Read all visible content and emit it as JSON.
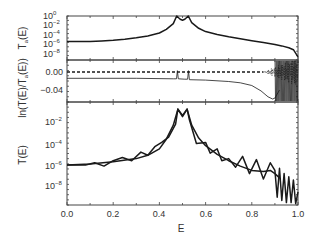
{
  "chart_data": [
    {
      "type": "line",
      "panel": "top",
      "ylabel": "T_a(E)",
      "yscale": "log",
      "ylim_log10": [
        -9.2,
        0.2
      ],
      "yticks": [
        "10^0",
        "10^-2",
        "10^-4",
        "10^-6",
        "10^-8"
      ],
      "xlim": [
        0.0,
        1.0
      ],
      "series": [
        {
          "name": "T_a(E)",
          "style": "solid-thick",
          "x": [
            0.0,
            0.05,
            0.1,
            0.15,
            0.2,
            0.25,
            0.3,
            0.35,
            0.4,
            0.43,
            0.46,
            0.475,
            0.49,
            0.5,
            0.51,
            0.525,
            0.54,
            0.57,
            0.6,
            0.65,
            0.7,
            0.75,
            0.8,
            0.85,
            0.9,
            0.93,
            0.96,
            0.98,
            1.0
          ],
          "log10": [
            -5.6,
            -5.6,
            -5.55,
            -5.45,
            -5.3,
            -5.1,
            -4.8,
            -4.4,
            -3.8,
            -3.0,
            -1.8,
            -0.2,
            -0.9,
            -1.1,
            -0.9,
            -0.2,
            -1.6,
            -2.8,
            -3.5,
            -4.1,
            -4.6,
            -5.0,
            -5.4,
            -5.8,
            -6.2,
            -6.5,
            -6.9,
            -7.3,
            -8.8
          ]
        }
      ]
    },
    {
      "type": "line",
      "panel": "middle",
      "ylabel": "ln(T(E)/T_a(E))",
      "ylim": [
        -0.065,
        0.02
      ],
      "yticks": [
        "0.00",
        "-0.04"
      ],
      "xlim": [
        0.0,
        1.0
      ],
      "series": [
        {
          "name": "reference (dashed)",
          "style": "dashed",
          "x": [
            0.0,
            0.85
          ],
          "y": [
            0.0,
            0.0
          ]
        },
        {
          "name": "ln(T/T_a)",
          "style": "solid-thin",
          "x": [
            0.0,
            0.3,
            0.46,
            0.474,
            0.478,
            0.482,
            0.51,
            0.522,
            0.526,
            0.53,
            0.6,
            0.7,
            0.75,
            0.8,
            0.84,
            0.87,
            0.89,
            0.9,
            0.92
          ],
          "y": [
            -0.014,
            -0.014,
            -0.015,
            -0.015,
            0.003,
            -0.015,
            -0.016,
            -0.016,
            0.003,
            -0.017,
            -0.018,
            -0.021,
            -0.024,
            -0.03,
            -0.042,
            -0.055,
            -0.06,
            -0.058,
            -0.04
          ]
        }
      ],
      "annotation": "dense oscillations between E≈0.85 and 1.0"
    },
    {
      "type": "line",
      "panel": "bottom",
      "ylabel": "T(E)",
      "xlabel": "E",
      "yscale": "log",
      "ylim_log10": [
        -9.8,
        -0.7
      ],
      "yticks": [
        "10^-2",
        "10^-4",
        "10^-6",
        "10^-8"
      ],
      "xlim": [
        0.0,
        1.0
      ],
      "xticks": [
        "0.0",
        "0.2",
        "0.4",
        "0.6",
        "0.8",
        "1.0"
      ],
      "series": [
        {
          "name": "smooth envelope",
          "style": "solid-thick",
          "x": [
            0.0,
            0.1,
            0.2,
            0.3,
            0.35,
            0.4,
            0.43,
            0.46,
            0.48,
            0.5,
            0.52,
            0.54,
            0.57,
            0.6,
            0.65,
            0.7,
            0.75,
            0.8,
            0.85,
            0.88,
            0.9,
            0.92
          ],
          "log10": [
            -6.0,
            -5.9,
            -5.7,
            -5.4,
            -5.1,
            -4.5,
            -3.6,
            -2.3,
            -0.8,
            -1.5,
            -0.8,
            -2.3,
            -3.5,
            -4.2,
            -5.0,
            -5.6,
            -6.1,
            -6.5,
            -6.6,
            -6.5,
            -6.8,
            -7.2
          ]
        },
        {
          "name": "oscillating T(E)",
          "style": "solid-thick",
          "x": [
            0.0,
            0.08,
            0.12,
            0.16,
            0.2,
            0.24,
            0.28,
            0.32,
            0.35,
            0.38,
            0.41,
            0.44,
            0.47,
            0.48,
            0.5,
            0.52,
            0.53,
            0.56,
            0.6,
            0.62,
            0.65,
            0.67,
            0.7,
            0.73,
            0.76,
            0.79,
            0.82,
            0.85,
            0.88,
            0.9,
            0.91,
            0.92,
            0.93,
            0.94,
            0.95,
            0.96,
            0.97,
            0.98,
            0.99,
            1.0
          ],
          "log10": [
            -6.0,
            -6.0,
            -5.8,
            -6.1,
            -5.6,
            -5.3,
            -5.6,
            -4.8,
            -5.1,
            -4.3,
            -3.9,
            -3.4,
            -2.2,
            -0.8,
            -1.4,
            -0.8,
            -1.8,
            -4.0,
            -3.9,
            -4.9,
            -4.5,
            -5.6,
            -5.4,
            -6.2,
            -5.2,
            -6.8,
            -5.5,
            -7.3,
            -5.8,
            -6.5,
            -9.0,
            -6.3,
            -9.3,
            -6.8,
            -9.5,
            -7.1,
            -9.5,
            -7.4,
            -9.6,
            -8.5
          ]
        }
      ]
    }
  ],
  "axes": {
    "top_ylabel": "T",
    "top_ylabel_sub": "a",
    "top_ylabel_tail": "(E)",
    "mid_ylabel_pre": "ln(T(E)/T",
    "mid_ylabel_sub": "a",
    "mid_ylabel_tail": "(E))",
    "bottom_ylabel": "T(E)",
    "xlabel": "E",
    "xticks": [
      "0.0",
      "0.2",
      "0.4",
      "0.6",
      "0.8",
      "1.0"
    ],
    "top_yticks": [
      {
        "base": "10",
        "exp": "0"
      },
      {
        "base": "10",
        "exp": "−2"
      },
      {
        "base": "10",
        "exp": "−4"
      },
      {
        "base": "10",
        "exp": "−6"
      },
      {
        "base": "10",
        "exp": "−8"
      }
    ],
    "mid_yticks": [
      "0.00",
      "−0.04"
    ],
    "bottom_yticks": [
      {
        "base": "10",
        "exp": "−2"
      },
      {
        "base": "10",
        "exp": "−4"
      },
      {
        "base": "10",
        "exp": "−6"
      },
      {
        "base": "10",
        "exp": "−8"
      }
    ]
  },
  "colors": {
    "line": "#1a1a1a",
    "axis": "#444444",
    "text": "#333333"
  }
}
